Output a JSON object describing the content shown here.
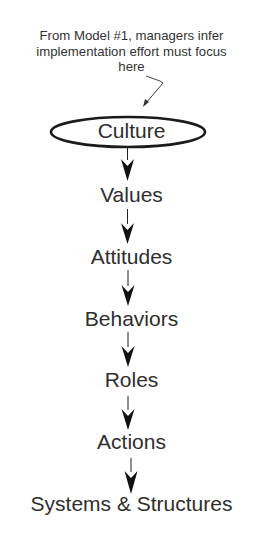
{
  "annotation": {
    "lines": [
      "From Model #1, managers infer",
      "implementation effort must focus",
      "here"
    ]
  },
  "flow": {
    "highlighted": "Culture",
    "nodes": [
      {
        "label": "Culture"
      },
      {
        "label": "Values"
      },
      {
        "label": "Attitudes"
      },
      {
        "label": "Behaviors"
      },
      {
        "label": "Roles"
      },
      {
        "label": "Actions"
      },
      {
        "label": "Systems & Structures"
      }
    ]
  },
  "colors": {
    "text": "#2e2e2e",
    "stroke": "#1a1a1a",
    "background": "#ffffff"
  }
}
